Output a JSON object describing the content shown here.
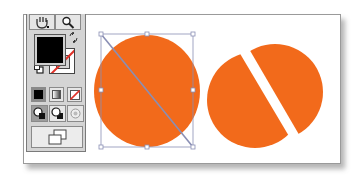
{
  "app": "Illustrator-style drawing canvas",
  "colors": {
    "shape_fill": "#f26a1b",
    "selection": "#8a8fb5",
    "toolbox_bg": "#d4d4d4",
    "fill_swatch": "#000000",
    "none_slash": "#e0332a"
  },
  "toolbox": {
    "top_tools": [
      {
        "name": "hand-tool",
        "icon": "hand-icon"
      },
      {
        "name": "zoom-tool",
        "icon": "magnifier-icon"
      }
    ],
    "fill_stroke": {
      "fill_color": "#000000",
      "stroke": "none",
      "swap_icon": "swap-arrows-icon",
      "default_icon": "default-colors-icon"
    },
    "color_modes": [
      {
        "name": "color",
        "icon": "solid-color-icon"
      },
      {
        "name": "gradient",
        "icon": "gradient-icon"
      },
      {
        "name": "none",
        "icon": "none-icon"
      }
    ],
    "draw_modes": [
      {
        "name": "draw-normal",
        "active": true
      },
      {
        "name": "draw-behind",
        "active": false
      },
      {
        "name": "draw-inside",
        "active": false
      }
    ],
    "screen_mode": {
      "name": "change-screen-mode",
      "icon": "screen-mode-icon"
    }
  },
  "canvas": {
    "shapes": [
      {
        "type": "circle",
        "label": "selected-circle",
        "selected": true,
        "cut_line": "diagonal",
        "bbox": {
          "x": 101,
          "y": 34,
          "w": 92,
          "h": 113
        }
      },
      {
        "type": "split-circle",
        "label": "divided-circle",
        "pieces": 2
      }
    ]
  }
}
